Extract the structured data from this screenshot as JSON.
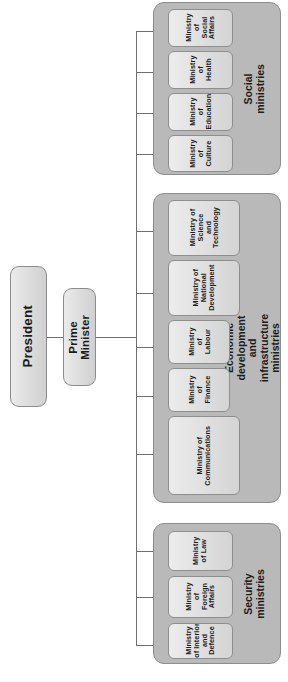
{
  "diagram": {
    "type": "org-chart",
    "orientation": "rotated-90",
    "colors": {
      "group_background": "#b9b9b9",
      "node_background": "#dcdcdc",
      "border": "#8a8a8a",
      "connector": "#6e6e6e",
      "text": "#1a1a1a"
    }
  },
  "executive": {
    "president": {
      "label": "President"
    },
    "prime_minister": {
      "label": "Prime\nMinister"
    }
  },
  "groups": [
    {
      "id": "social",
      "label": "Social ministries",
      "ministries": [
        {
          "label": "Ministry\nof\nSocial\nAffairs"
        },
        {
          "label": "Ministry\nof\nHealth"
        },
        {
          "label": "Ministry\nof\nEducation"
        },
        {
          "label": "Ministry\nof\nCulture"
        }
      ]
    },
    {
      "id": "economic",
      "label": "Economic development and infrastructure ministries",
      "ministries": [
        {
          "label": "Ministry of\nScience\nand\nTechnology"
        },
        {
          "label": "Ministry of\nNational\nDevelopment"
        },
        {
          "label": "Ministry\nof\nLabour"
        },
        {
          "label": "Ministry\nof\nFinance"
        },
        {
          "label": "Ministry of\nCommunications"
        }
      ]
    },
    {
      "id": "security",
      "label": "Security ministries",
      "ministries": [
        {
          "label": "Ministry\nof Law"
        },
        {
          "label": "Ministry\nof\nForeign\nAffairs"
        },
        {
          "label": "Ministry\nof Interior\nand\nDefence"
        }
      ]
    }
  ]
}
